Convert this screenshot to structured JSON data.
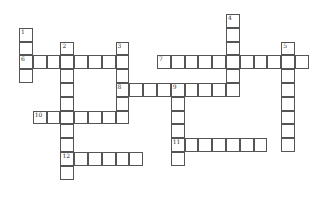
{
  "puzzle": {
    "type": "crossword",
    "cell_size": 13.8,
    "origin": {
      "x": 19,
      "y": 14
    },
    "border_color": "#555555",
    "words": [
      {
        "number": "1",
        "direction": "down",
        "col": 0,
        "row": 1,
        "length": 4
      },
      {
        "number": "2",
        "direction": "down",
        "col": 3,
        "row": 2,
        "length": 10
      },
      {
        "number": "3",
        "direction": "down",
        "col": 7,
        "row": 2,
        "length": 6
      },
      {
        "number": "4",
        "direction": "down",
        "col": 15,
        "row": 0,
        "length": 6
      },
      {
        "number": "5",
        "direction": "down",
        "col": 19,
        "row": 2,
        "length": 8
      },
      {
        "number": "6",
        "direction": "across",
        "col": 0,
        "row": 3,
        "length": 8
      },
      {
        "number": "7",
        "direction": "across",
        "col": 10,
        "row": 3,
        "length": 11
      },
      {
        "number": "8",
        "direction": "across",
        "col": 7,
        "row": 5,
        "length": 9
      },
      {
        "number": "9",
        "direction": "down",
        "col": 11,
        "row": 5,
        "length": 6
      },
      {
        "number": "10",
        "direction": "across",
        "col": 1,
        "row": 7,
        "length": 7
      },
      {
        "number": "11",
        "direction": "across",
        "col": 11,
        "row": 9,
        "length": 7
      },
      {
        "number": "12",
        "direction": "across",
        "col": 3,
        "row": 10,
        "length": 6
      }
    ]
  }
}
